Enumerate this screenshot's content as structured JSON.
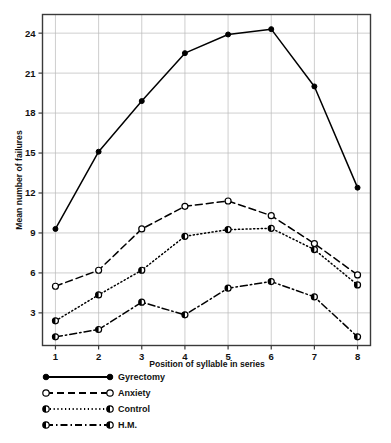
{
  "figure": {
    "background": "#ffffff",
    "ink_color": "#000000",
    "grid_color": "#b9b9b9"
  },
  "chart_data": {
    "type": "line",
    "title": "",
    "xlabel": "Position of syllable in series",
    "ylabel": "Mean number of failures",
    "x": [
      1,
      2,
      3,
      4,
      5,
      6,
      7,
      8
    ],
    "categories": [
      "1",
      "2",
      "3",
      "4",
      "5",
      "6",
      "7",
      "8"
    ],
    "xtick_labels": [
      "1",
      "2",
      "3",
      "4",
      "5",
      "6",
      "7",
      "8"
    ],
    "ytick_labels": [
      "3",
      "6",
      "9",
      "12",
      "15",
      "18",
      "21",
      "24"
    ],
    "yticks": [
      3,
      6,
      9,
      12,
      15,
      18,
      21,
      24
    ],
    "xlim": [
      0.7,
      8.3
    ],
    "ylim": [
      0.55,
      25.4
    ],
    "grid": true,
    "grid_axis": "both",
    "legend_position": "below-axes-left",
    "series": [
      {
        "name": "Gyrectomy",
        "values": [
          9.3,
          15.1,
          18.9,
          22.5,
          23.9,
          24.3,
          20.0,
          12.4
        ],
        "line_style": "solid",
        "marker": "filled-circle"
      },
      {
        "name": "Anxiety",
        "values": [
          5.0,
          6.2,
          9.3,
          11.0,
          11.4,
          10.3,
          8.2,
          5.85
        ],
        "line_style": "dashed",
        "marker": "open-circle"
      },
      {
        "name": "Control",
        "values": [
          2.4,
          4.35,
          6.2,
          8.75,
          9.25,
          9.35,
          7.75,
          5.1
        ],
        "line_style": "dotted",
        "marker": "half-filled-circle"
      },
      {
        "name": "H.M.",
        "values": [
          1.2,
          1.75,
          3.8,
          2.85,
          4.85,
          5.35,
          4.2,
          1.2
        ],
        "line_style": "dash-dot",
        "marker": "half-filled-circle"
      }
    ]
  },
  "legend": {
    "items": [
      {
        "label": "Gyrectomy",
        "style": "solid",
        "marker": "filled-circle"
      },
      {
        "label": "Anxiety",
        "style": "dashed",
        "marker": "open-circle"
      },
      {
        "label": "Control",
        "style": "dotted",
        "marker": "half-filled-circle"
      },
      {
        "label": "H.M.",
        "style": "dash-dot",
        "marker": "half-filled-circle"
      }
    ]
  }
}
